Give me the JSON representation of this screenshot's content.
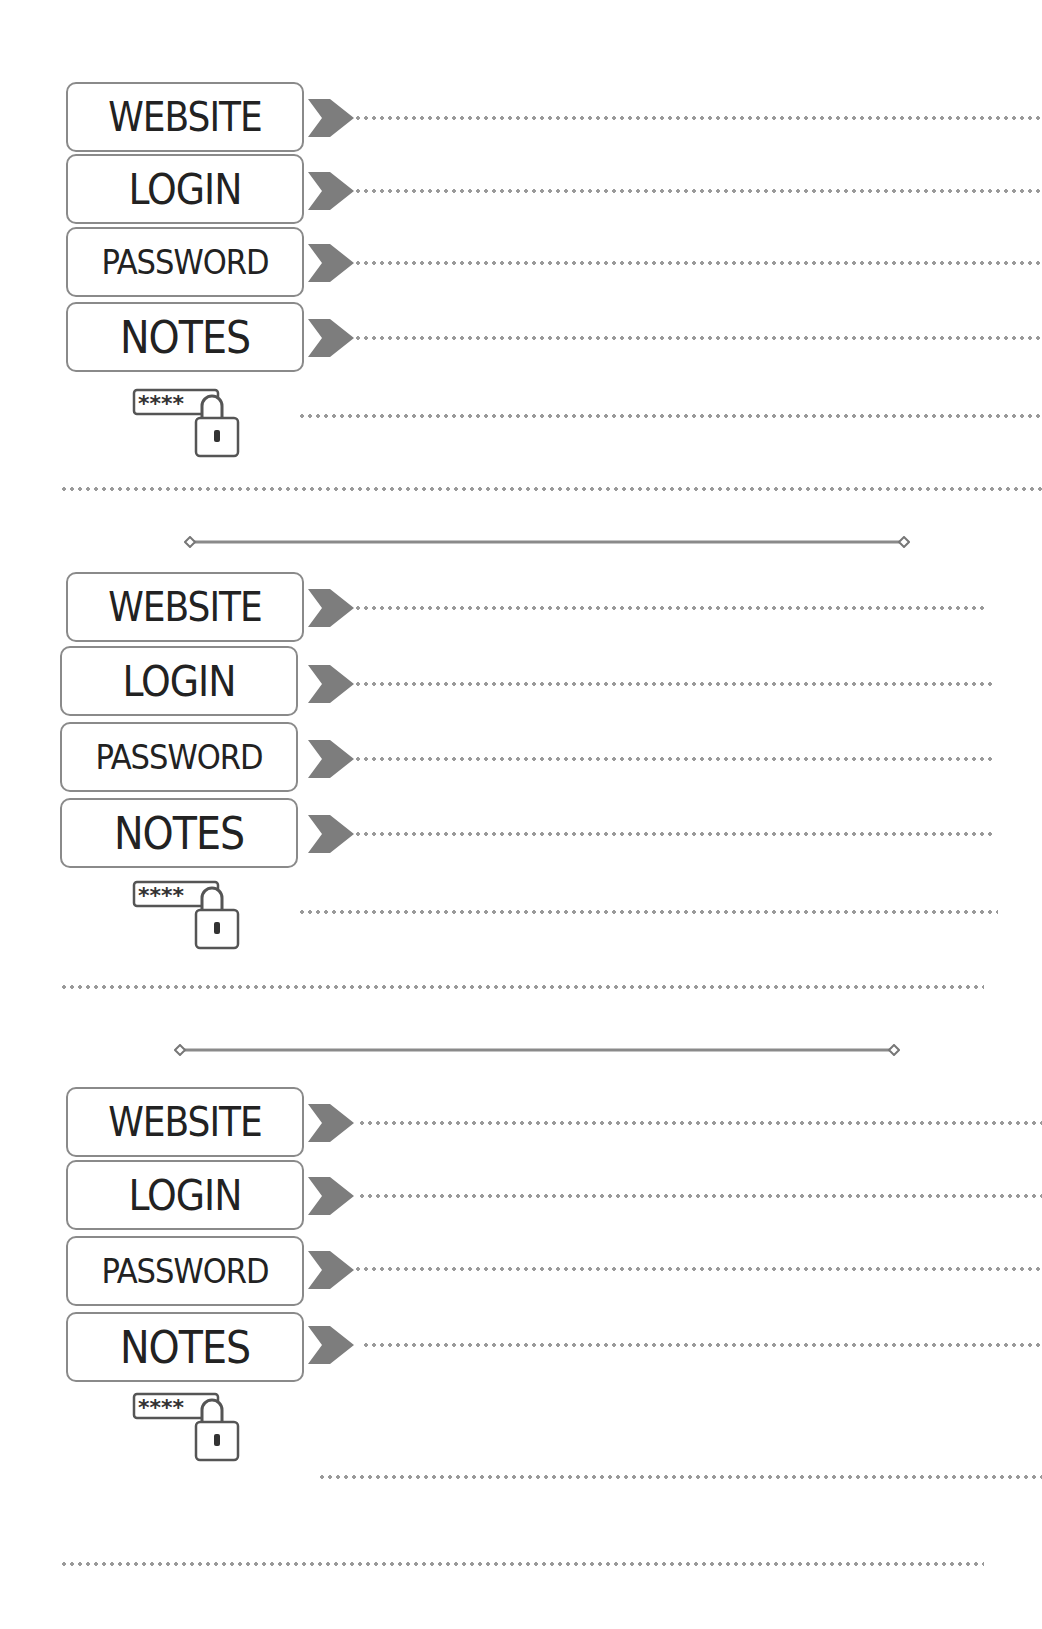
{
  "document": {
    "type": "password log template",
    "accent_color": "#8a8a8a",
    "text_color": "#222222"
  },
  "entries": [
    {
      "fields": [
        {
          "label": "WEBSITE",
          "icon": "chevron-right-icon"
        },
        {
          "label": "LOGIN",
          "icon": "chevron-right-icon"
        },
        {
          "label": "PASSWORD",
          "icon": "chevron-right-icon"
        },
        {
          "label": "NOTES",
          "icon": "chevron-right-icon"
        }
      ],
      "lock_icon": {
        "masked_text": "****",
        "icon": "password-lock-icon"
      }
    },
    {
      "fields": [
        {
          "label": "WEBSITE",
          "icon": "chevron-right-icon"
        },
        {
          "label": "LOGIN",
          "icon": "chevron-right-icon"
        },
        {
          "label": "PASSWORD",
          "icon": "chevron-right-icon"
        },
        {
          "label": "NOTES",
          "icon": "chevron-right-icon"
        }
      ],
      "lock_icon": {
        "masked_text": "****",
        "icon": "password-lock-icon"
      }
    },
    {
      "fields": [
        {
          "label": "WEBSITE",
          "icon": "chevron-right-icon"
        },
        {
          "label": "LOGIN",
          "icon": "chevron-right-icon"
        },
        {
          "label": "PASSWORD",
          "icon": "chevron-right-icon"
        },
        {
          "label": "NOTES",
          "icon": "chevron-right-icon"
        }
      ],
      "lock_icon": {
        "masked_text": "****",
        "icon": "password-lock-icon"
      }
    }
  ]
}
